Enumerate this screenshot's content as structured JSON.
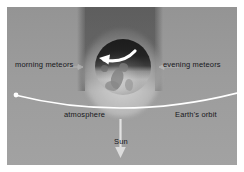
{
  "figure": {
    "background_color": "#9b9b9b",
    "frame_color": "#ffffff",
    "line_color": "#ffffff",
    "text_color": "#17171b"
  },
  "labels": {
    "morning_meteors": "morning meteors",
    "evening_meteors": "evening meteors",
    "atmosphere": "atmosphere",
    "earths_orbit": "Earth's orbit",
    "sun": "Sun"
  },
  "icons": {
    "rotation_arrow": "curved-rotation-arrow-icon",
    "sun_arrow": "down-arrow-icon",
    "morning_pointer": "right-arrow-icon",
    "evening_pointer": "left-arrow-icon",
    "orbit_endpoint": "orbit-endpoint-dot-icon",
    "earth": "earth-globe-icon",
    "shadow": "shadow-cone-icon",
    "glow": "atmosphere-glow-icon"
  },
  "diagram_elements": {
    "earth_rotation_direction": "counterclockwise (toward the left / morning side)",
    "orbit_curve": "arc spanning the full width, apex beneath the Earth",
    "sun_direction": "downward, below the figure",
    "shadow_band": "vertical night-side shadow cone extending upward from Earth"
  }
}
